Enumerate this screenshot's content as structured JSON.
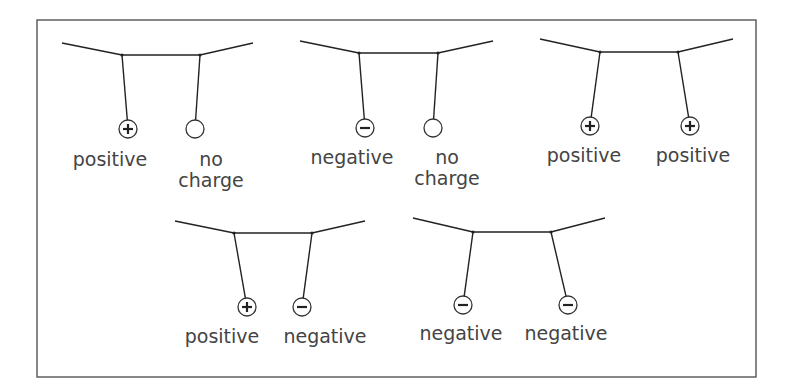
{
  "diagram": {
    "frame": {
      "x": 37,
      "y": 20,
      "width": 719,
      "height": 357
    },
    "colors": {
      "line": "#222222",
      "text": "#444444",
      "frame": "#555555"
    },
    "panels": [
      {
        "id": "panel-1",
        "string": [
          [
            62,
            43
          ],
          [
            122,
            55
          ],
          [
            200,
            55
          ],
          [
            253,
            43
          ]
        ],
        "balls": [
          {
            "anchor": [
              122,
              55
            ],
            "center": [
              128,
              129
            ],
            "charge": "positive",
            "sign": "+",
            "label_lines": [
              "positive"
            ],
            "label_x": 110,
            "label_y": 166
          },
          {
            "anchor": [
              200,
              55
            ],
            "center": [
              195,
              129
            ],
            "charge": "none",
            "sign": "",
            "label_lines": [
              "no",
              "charge"
            ],
            "label_x": 211,
            "label_y": 166
          }
        ]
      },
      {
        "id": "panel-2",
        "string": [
          [
            300,
            41
          ],
          [
            359,
            53
          ],
          [
            438,
            53
          ],
          [
            493,
            41
          ]
        ],
        "balls": [
          {
            "anchor": [
              359,
              53
            ],
            "center": [
              365,
              128
            ],
            "charge": "negative",
            "sign": "-",
            "label_lines": [
              "negative"
            ],
            "label_x": 352,
            "label_y": 164
          },
          {
            "anchor": [
              438,
              53
            ],
            "center": [
              433,
              128
            ],
            "charge": "none",
            "sign": "",
            "label_lines": [
              "no",
              "charge"
            ],
            "label_x": 447,
            "label_y": 164
          }
        ]
      },
      {
        "id": "panel-3",
        "string": [
          [
            540,
            39
          ],
          [
            600,
            52
          ],
          [
            678,
            52
          ],
          [
            733,
            39
          ]
        ],
        "balls": [
          {
            "anchor": [
              600,
              52
            ],
            "center": [
              590,
              126
            ],
            "charge": "positive",
            "sign": "+",
            "label_lines": [
              "positive"
            ],
            "label_x": 584,
            "label_y": 162
          },
          {
            "anchor": [
              678,
              52
            ],
            "center": [
              690,
              126
            ],
            "charge": "positive",
            "sign": "+",
            "label_lines": [
              "positive"
            ],
            "label_x": 693,
            "label_y": 162
          }
        ]
      },
      {
        "id": "panel-4",
        "string": [
          [
            175,
            221
          ],
          [
            234,
            233
          ],
          [
            312,
            233
          ],
          [
            365,
            221
          ]
        ],
        "balls": [
          {
            "anchor": [
              234,
              233
            ],
            "center": [
              247,
              307
            ],
            "charge": "positive",
            "sign": "+",
            "label_lines": [
              "positive"
            ],
            "label_x": 222,
            "label_y": 343
          },
          {
            "anchor": [
              312,
              233
            ],
            "center": [
              302,
              307
            ],
            "charge": "negative",
            "sign": "-",
            "label_lines": [
              "negative"
            ],
            "label_x": 325,
            "label_y": 343
          }
        ]
      },
      {
        "id": "panel-5",
        "string": [
          [
            413,
            218
          ],
          [
            473,
            232
          ],
          [
            551,
            232
          ],
          [
            605,
            218
          ]
        ],
        "balls": [
          {
            "anchor": [
              473,
              232
            ],
            "center": [
              463,
              305
            ],
            "charge": "negative",
            "sign": "-",
            "label_lines": [
              "negative"
            ],
            "label_x": 461,
            "label_y": 340
          },
          {
            "anchor": [
              551,
              232
            ],
            "center": [
              568,
              305
            ],
            "charge": "negative",
            "sign": "-",
            "label_lines": [
              "negative"
            ],
            "label_x": 566,
            "label_y": 340
          }
        ]
      }
    ]
  }
}
